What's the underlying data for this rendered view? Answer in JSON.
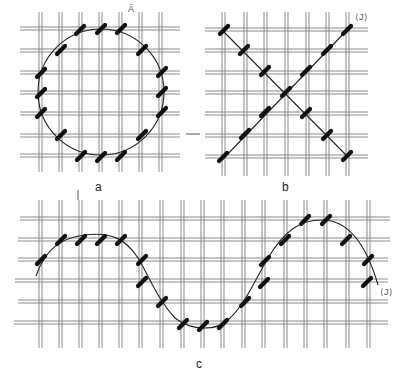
{
  "figure": {
    "panels": [
      {
        "id": "a",
        "label": "a",
        "shape": "circle",
        "marker": "Ⓐ"
      },
      {
        "id": "b",
        "label": "b",
        "shape": "diagonal cross",
        "marker": "〈J〉"
      },
      {
        "id": "c",
        "label": "c",
        "shape": "sine wave",
        "marker": "〈J〉"
      }
    ]
  },
  "labels": {
    "a": "a",
    "b": "b",
    "c": "c",
    "mark_a": "Ä",
    "mark_b": "⟨J⟩",
    "mark_c": "⟨J⟩"
  },
  "colors": {
    "thread": "#8a8a8a",
    "stitch": "#111111",
    "curve": "#222222",
    "background": "#ffffff"
  }
}
